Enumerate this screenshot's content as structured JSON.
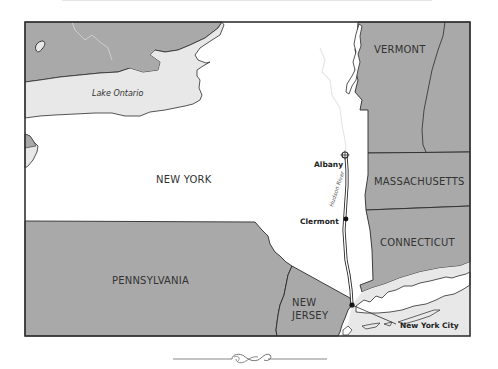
{
  "map": {
    "title": "",
    "colors": {
      "land_other_states": "#a9a9a9",
      "land_new_york": "#ffffff",
      "water": "#e8e8e8",
      "border": "#2b2b2b",
      "frame": "#333333"
    },
    "regions": {
      "new_york": "NEW YORK",
      "vermont": "VERMONT",
      "massachusetts": "MASSACHUSETTS",
      "connecticut": "CONNECTICUT",
      "pennsylvania": "PENNSYLVANIA",
      "new_jersey_line1": "NEW",
      "new_jersey_line2": "JERSEY"
    },
    "water_bodies": {
      "lake_ontario": "Lake Ontario",
      "hudson_river": "Hudson River"
    },
    "cities": [
      {
        "name": "Albany",
        "marker": "star-marker"
      },
      {
        "name": "Clermont",
        "marker": "dot-marker"
      },
      {
        "name": "New York City",
        "marker": "dot-marker"
      }
    ]
  },
  "decor": {
    "divider": "ornamental-flourish"
  }
}
